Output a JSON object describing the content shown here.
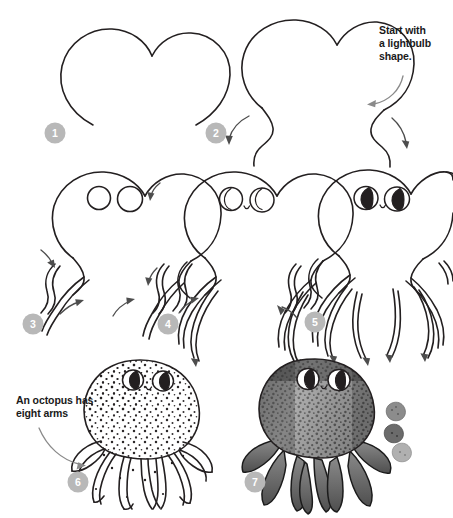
{
  "page": {
    "background_color": "#ffffff",
    "ink_color": "#231f20",
    "badge_color": "#b8b8b8",
    "badge_text_color": "#ffffff",
    "note_text_color": "#1a1a1a"
  },
  "notes": [
    {
      "id": "note-1",
      "text": "Start with\na lightbulb\nshape.",
      "near_step": "2"
    },
    {
      "id": "note-2",
      "text": "An octopus has\neight arms",
      "near_step": "6"
    }
  ],
  "steps": [
    {
      "number": "1",
      "label": "Step 1",
      "caption": "Draw the lightbulb shaped head outline",
      "badge_x": 55,
      "badge_y": 133
    },
    {
      "number": "2",
      "label": "Step 2",
      "caption": "Add the wavy body sides with guide arrows",
      "badge_x": 216,
      "badge_y": 133
    },
    {
      "number": "3",
      "label": "Step 3",
      "caption": "Add two circles for eyes and begin the arms",
      "badge_x": 33,
      "badge_y": 324
    },
    {
      "number": "4",
      "label": "Step 4",
      "caption": "Add crescent pupils, a small mouth and more arms",
      "badge_x": 168,
      "badge_y": 324
    },
    {
      "number": "5",
      "label": "Step 5",
      "caption": "Fill in the pupils and complete all eight arms",
      "badge_x": 315,
      "badge_y": 322
    },
    {
      "number": "6",
      "label": "Step 6",
      "caption": "Stipple the body with dots for texture",
      "badge_x": 78,
      "badge_y": 482
    },
    {
      "number": "7",
      "label": "Step 7",
      "caption": "Shade the whole octopus in gray tones",
      "badge_x": 255,
      "badge_y": 482
    }
  ],
  "swatches": [
    {
      "name": "swatch-light",
      "tone": "#8c8c8c"
    },
    {
      "name": "swatch-dark",
      "tone": "#6b6b6b"
    },
    {
      "name": "swatch-pale",
      "tone": "#b0b0b0"
    }
  ]
}
